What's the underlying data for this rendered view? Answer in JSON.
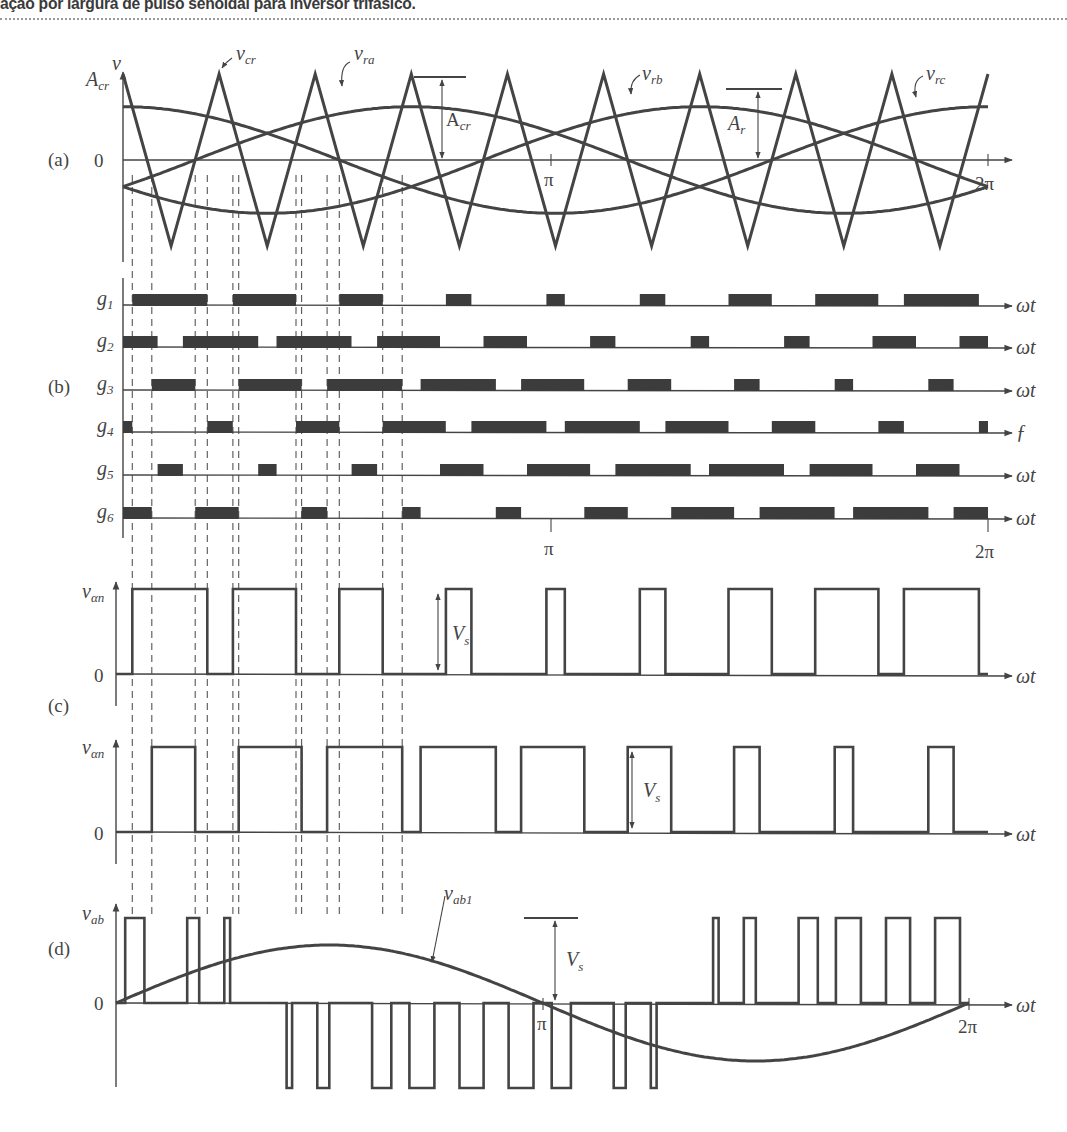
{
  "caption": "ação por largura de pulso senoidal para inversor trifásico.",
  "chart_data": [
    {
      "panel": "(a)",
      "type": "line",
      "title": "",
      "ylabel": "v",
      "ylabel_top": "A_cr",
      "zero_label": "0",
      "x_ticks": [
        "π",
        "2π"
      ],
      "xlim": [
        0,
        6.2832
      ],
      "ylim": [
        -1,
        1
      ],
      "carrier": {
        "name": "v_cr",
        "type": "triangle",
        "amplitude": 1.0,
        "cycles_per_period": 9,
        "label": "v_cr"
      },
      "references": [
        {
          "name": "v_ra",
          "label": "v_ra",
          "amplitude": 0.62,
          "phase_deg": 0
        },
        {
          "name": "v_rb",
          "label": "v_rb",
          "amplitude": 0.62,
          "phase_deg": -120
        },
        {
          "name": "v_rc",
          "label": "v_rc",
          "amplitude": 0.62,
          "phase_deg": 120
        }
      ],
      "annotations": [
        "A_cr",
        "A_r"
      ]
    },
    {
      "panel": "(b)",
      "type": "bar",
      "signals": [
        {
          "label": "g1",
          "axis_label": "ωt"
        },
        {
          "label": "g2",
          "axis_label": "ωt"
        },
        {
          "label": "g3",
          "axis_label": "ωt"
        },
        {
          "label": "g4",
          "axis_label": "ƒ"
        },
        {
          "label": "g5",
          "axis_label": "ωt"
        },
        {
          "label": "g6",
          "axis_label": "ωt"
        }
      ],
      "x_ticks": [
        "π",
        "2π"
      ],
      "xlim": [
        0,
        6.2832
      ]
    },
    {
      "panel": "(c)",
      "type": "line",
      "series": [
        {
          "name": "v_an (leg a)",
          "ylabel": "v_αn",
          "zero_label": "0",
          "xlabel": "ωt",
          "amplitude_label": "V_s"
        },
        {
          "name": "v_bn (leg b)",
          "ylabel": "v_αn",
          "zero_label": "0",
          "xlabel": "ωt",
          "amplitude_label": "V_s"
        }
      ],
      "xlim": [
        0,
        6.2832
      ],
      "ylim": [
        0,
        1
      ]
    },
    {
      "panel": "(d)",
      "type": "line",
      "ylabel": "v_ab",
      "zero_label": "0",
      "xlabel": "ωt",
      "x_ticks": [
        "π",
        "2π"
      ],
      "series": [
        {
          "name": "v_ab",
          "desc": "line-to-line PWM (+V_s / 0 / -V_s)"
        },
        {
          "name": "v_ab1",
          "label": "v_ab1",
          "desc": "fundamental",
          "amplitude": 0.62,
          "phase_deg": 30
        }
      ],
      "amplitude_label": "V_s",
      "xlim": [
        0,
        6.2832
      ],
      "ylim": [
        -1,
        1
      ]
    }
  ],
  "labels": {
    "panel_a": "(a)",
    "panel_b": "(b)",
    "panel_c": "(c)",
    "panel_d": "(d)",
    "v": "v",
    "Acr_axis": "A",
    "Acr_axis_sub": "cr",
    "zero": "0",
    "vcr": "v",
    "vcr_sub": "cr",
    "vra": "v",
    "vra_sub": "ra",
    "vrb": "v",
    "vrb_sub": "rb",
    "vrc": "v",
    "vrc_sub": "rc",
    "Acr_ann": "A",
    "Acr_ann_sub": "cr",
    "Ar": "A",
    "Ar_sub": "r",
    "pi": "π",
    "two_pi": "2π",
    "wt": "ωt",
    "g4_axis": "ƒ",
    "g": "g",
    "g_subs": [
      "1",
      "2",
      "3",
      "4",
      "5",
      "6"
    ],
    "van": "v",
    "van_sub": "αn",
    "Vs": "V",
    "Vs_sub": "s",
    "vab": "v",
    "vab_sub": "ab",
    "vab1": "v",
    "vab1_sub": "ab1"
  }
}
